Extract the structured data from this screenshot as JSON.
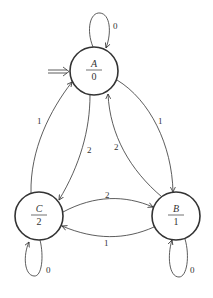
{
  "diagram": {
    "type": "state-machine (Moore)",
    "start_state": "A",
    "nodes": [
      {
        "id": "A",
        "name": "A",
        "output": "0"
      },
      {
        "id": "B",
        "name": "B",
        "output": "1"
      },
      {
        "id": "C",
        "name": "C",
        "output": "2"
      }
    ],
    "edges": [
      {
        "from": "A",
        "to": "A",
        "label": "0"
      },
      {
        "from": "A",
        "to": "B",
        "label": "1"
      },
      {
        "from": "A",
        "to": "C",
        "label": "2"
      },
      {
        "from": "B",
        "to": "A",
        "label": "2"
      },
      {
        "from": "B",
        "to": "C",
        "label": "1"
      },
      {
        "from": "B",
        "to": "B",
        "label": "0"
      },
      {
        "from": "C",
        "to": "A",
        "label": "1"
      },
      {
        "from": "C",
        "to": "B",
        "label": "2"
      },
      {
        "from": "C",
        "to": "C",
        "label": "0"
      }
    ]
  }
}
